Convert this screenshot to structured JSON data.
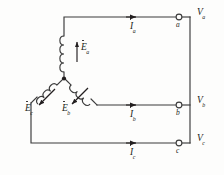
{
  "diagram": {
    "stroke_color": "#3a3a3a",
    "text_color": "#231f20",
    "background": "#fdfdfc"
  },
  "phases": [
    {
      "id": "a",
      "emf_label": "E",
      "emf_sub": "a",
      "current_label": "I",
      "current_sub": "a",
      "terminal_label": "a",
      "voltage_label": "V",
      "voltage_sub": "a"
    },
    {
      "id": "b",
      "emf_label": "E",
      "emf_sub": "b",
      "current_label": "I",
      "current_sub": "b",
      "terminal_label": "b",
      "voltage_label": "V",
      "voltage_sub": "b"
    },
    {
      "id": "c",
      "emf_label": "E",
      "emf_sub": "c",
      "current_label": "I",
      "current_sub": "c",
      "terminal_label": "c",
      "voltage_label": "V",
      "voltage_sub": "c"
    }
  ]
}
